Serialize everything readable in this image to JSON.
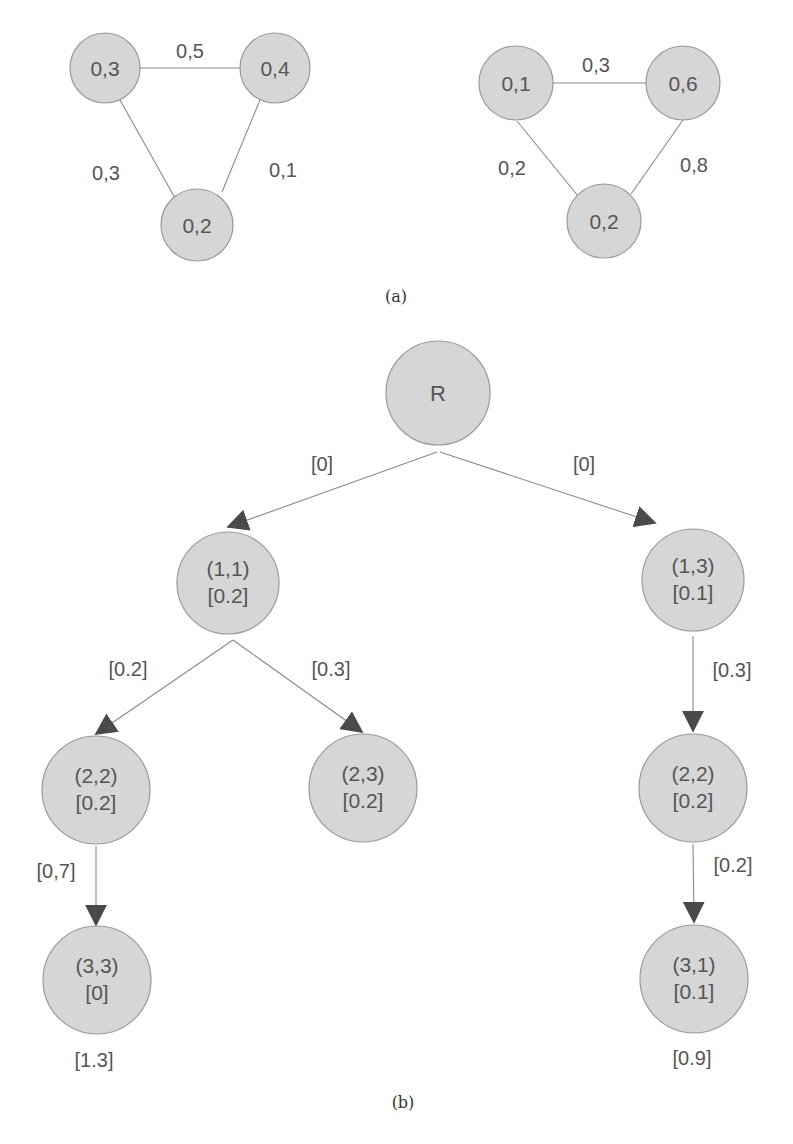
{
  "figure_a": {
    "caption": "(a)",
    "graph_left": {
      "nodes": [
        {
          "id": "n1",
          "label": "0,3"
        },
        {
          "id": "n2",
          "label": "0,4"
        },
        {
          "id": "n3",
          "label": "0,2"
        }
      ],
      "edges": [
        {
          "from": "n1",
          "to": "n2",
          "label": "0,5"
        },
        {
          "from": "n1",
          "to": "n3",
          "label": "0,3"
        },
        {
          "from": "n2",
          "to": "n3",
          "label": "0,1"
        }
      ]
    },
    "graph_right": {
      "nodes": [
        {
          "id": "m1",
          "label": "0,1"
        },
        {
          "id": "m2",
          "label": "0,6"
        },
        {
          "id": "m3",
          "label": "0,2"
        }
      ],
      "edges": [
        {
          "from": "m1",
          "to": "m2",
          "label": "0,3"
        },
        {
          "from": "m1",
          "to": "m3",
          "label": "0,2"
        },
        {
          "from": "m2",
          "to": "m3",
          "label": "0,8"
        }
      ]
    }
  },
  "figure_b": {
    "caption": "(b)",
    "nodes": [
      {
        "id": "R",
        "line1": "R",
        "line2": ""
      },
      {
        "id": "n11",
        "line1": "(1,1)",
        "line2": "[0.2]"
      },
      {
        "id": "n13",
        "line1": "(1,3)",
        "line2": "[0.1]"
      },
      {
        "id": "n22L",
        "line1": "(2,2)",
        "line2": "[0.2]"
      },
      {
        "id": "n23",
        "line1": "(2,3)",
        "line2": "[0.2]"
      },
      {
        "id": "n22R",
        "line1": "(2,2)",
        "line2": "[0.2]"
      },
      {
        "id": "n33",
        "line1": "(3,3)",
        "line2": "[0]",
        "total": "[1.3]"
      },
      {
        "id": "n31",
        "line1": "(3,1)",
        "line2": "[0.1]",
        "total": "[0.9]"
      }
    ],
    "edges": [
      {
        "from": "R",
        "to": "n11",
        "label": "[0]"
      },
      {
        "from": "R",
        "to": "n13",
        "label": "[0]"
      },
      {
        "from": "n11",
        "to": "n22L",
        "label": "[0.2]"
      },
      {
        "from": "n11",
        "to": "n23",
        "label": "[0.3]"
      },
      {
        "from": "n22L",
        "to": "n33",
        "label": "[0,7]"
      },
      {
        "from": "n13",
        "to": "n22R",
        "label": "[0.3]"
      },
      {
        "from": "n22R",
        "to": "n31",
        "label": "[0.2]"
      }
    ]
  }
}
